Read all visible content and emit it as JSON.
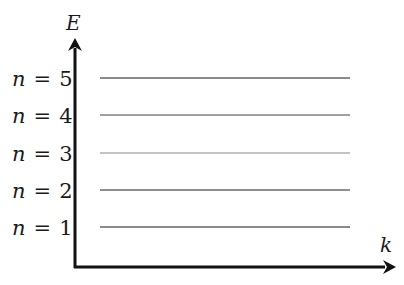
{
  "diagram": {
    "type": "energy-level-diagram",
    "axes": {
      "y_label": "E",
      "x_label": "k"
    },
    "levels": [
      {
        "n_symbol": "n",
        "eq": "=",
        "value": "5",
        "y": 78,
        "color": "#8c8c8c"
      },
      {
        "n_symbol": "n",
        "eq": "=",
        "value": "4",
        "y": 115,
        "color": "#a0a0a0"
      },
      {
        "n_symbol": "n",
        "eq": "=",
        "value": "3",
        "y": 153,
        "color": "#c4c4c4"
      },
      {
        "n_symbol": "n",
        "eq": "=",
        "value": "2",
        "y": 190,
        "color": "#8f8f8f"
      },
      {
        "n_symbol": "n",
        "eq": "=",
        "value": "1",
        "y": 227,
        "color": "#8a8a8a"
      }
    ],
    "colors": {
      "axis": "#111111",
      "background": "#ffffff"
    }
  }
}
